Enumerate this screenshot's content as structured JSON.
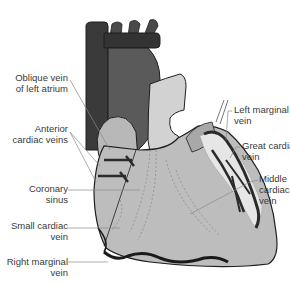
{
  "diagram": {
    "labels_left": [
      {
        "id": "oblique-vein",
        "lines": [
          "Oblique vein",
          "of left atrium"
        ]
      },
      {
        "id": "anterior-cardiac-veins",
        "lines": [
          "Anterior",
          "cardiac veins"
        ]
      },
      {
        "id": "coronary-sinus",
        "lines": [
          "Coronary",
          "sinus"
        ]
      },
      {
        "id": "small-cardiac-vein",
        "lines": [
          "Small cardiac",
          "vein"
        ]
      },
      {
        "id": "right-marginal-vein",
        "lines": [
          "Right marginal",
          "vein"
        ]
      }
    ],
    "labels_right": [
      {
        "id": "left-marginal-vein",
        "lines": [
          "Left marginal",
          "vein"
        ]
      },
      {
        "id": "great-cardiac-vein",
        "lines": [
          "Great cardiac",
          "vein"
        ]
      },
      {
        "id": "middle-cardiac-vein",
        "lines": [
          "Middle",
          "cardiac",
          "vein"
        ]
      }
    ],
    "colors": {
      "vessel_dark": "#3a3a3a",
      "atrium_dark": "#555555",
      "ventricle_light": "#bdbdbd",
      "pulmonary_light": "#d2d2d2",
      "outline": "#1e1e1e",
      "leader_line": "#8a8a8a",
      "label_text": "#3a3a3a",
      "fat_highlight": "#e6e6e6"
    }
  }
}
